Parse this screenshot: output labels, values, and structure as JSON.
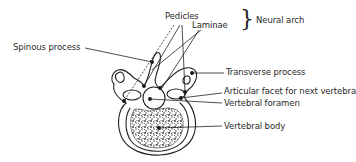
{
  "diagram": {
    "labels": {
      "pedicles": "Pedicles",
      "laminae": "Laminae",
      "neural_arch": "Neural arch",
      "spinous_process": "Spinous process",
      "transverse_process": "Transverse process",
      "articular_facet": "Articular facet for next vertebra",
      "vertebral_foramen": "Vertebral foramen",
      "vertebral_body": "Vertebral body"
    },
    "brace_glyph": "}",
    "colors": {
      "ink": "#222222",
      "background": "#ffffff"
    }
  }
}
